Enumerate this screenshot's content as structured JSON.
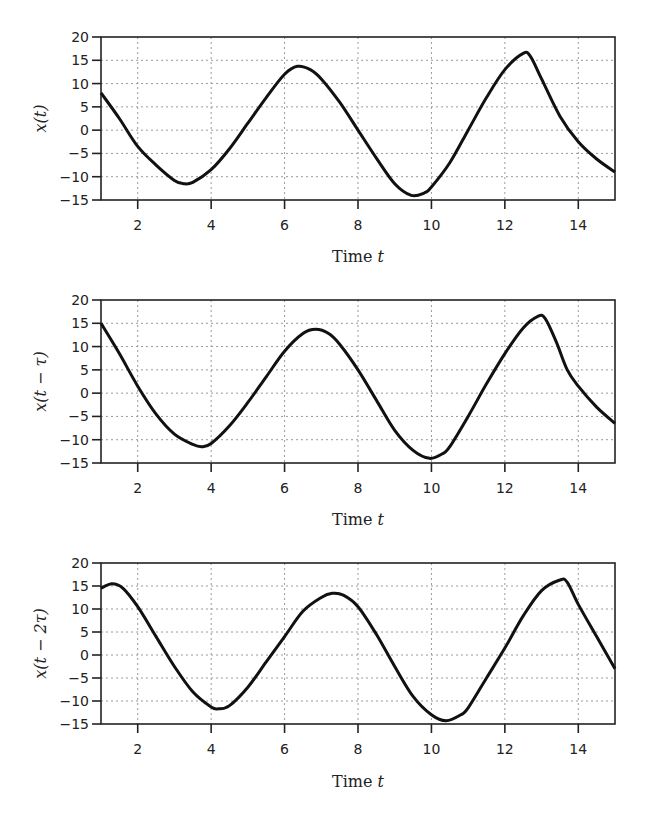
{
  "chart_data": [
    {
      "type": "line",
      "title": "",
      "xlabel": "Time t",
      "ylabel": "x(t)",
      "xlim": [
        1,
        15
      ],
      "ylim": [
        -15,
        20
      ],
      "xticks": [
        2,
        4,
        6,
        8,
        10,
        12,
        14
      ],
      "yticks": [
        20,
        15,
        10,
        5,
        0,
        -5,
        -10,
        -15
      ],
      "grid": true,
      "series": [
        {
          "name": "x(t)",
          "x": [
            1,
            1.5,
            2,
            2.5,
            3,
            3.25,
            3.5,
            4,
            4.5,
            5,
            5.5,
            6,
            6.35,
            6.7,
            7,
            7.5,
            8,
            8.5,
            9,
            9.45,
            9.8,
            10,
            10.5,
            11,
            11.5,
            12,
            12.5,
            12.7,
            13,
            13.5,
            14,
            14.5,
            15
          ],
          "y": [
            8,
            2.5,
            -3.5,
            -7.5,
            -10.8,
            -11.5,
            -11.2,
            -8.5,
            -4,
            1.5,
            7,
            12,
            13.7,
            13,
            11,
            6,
            0,
            -6,
            -11.5,
            -14,
            -13.5,
            -12.2,
            -7,
            0,
            7,
            13,
            16.5,
            15.8,
            11,
            3,
            -2.5,
            -6.2,
            -9
          ]
        }
      ]
    },
    {
      "type": "line",
      "title": "",
      "xlabel": "Time t",
      "ylabel": "x(t − τ)",
      "xlim": [
        1,
        15
      ],
      "ylim": [
        -15,
        20
      ],
      "xticks": [
        2,
        4,
        6,
        8,
        10,
        12,
        14
      ],
      "yticks": [
        20,
        15,
        10,
        5,
        0,
        -5,
        -10,
        -15
      ],
      "grid": true,
      "series": [
        {
          "name": "x(t − τ)",
          "x": [
            1,
            1.5,
            2,
            2.5,
            3,
            3.5,
            3.75,
            4,
            4.5,
            5,
            5.5,
            6,
            6.5,
            6.85,
            7.2,
            7.5,
            8,
            8.5,
            9,
            9.5,
            9.95,
            10.3,
            10.5,
            11,
            11.5,
            12,
            12.5,
            12.9,
            13.1,
            13.4,
            13.7,
            14,
            14.5,
            15
          ],
          "y": [
            15,
            8.5,
            1.5,
            -4.5,
            -8.8,
            -11,
            -11.5,
            -10.8,
            -7,
            -2,
            3.5,
            9,
            12.8,
            13.7,
            12.8,
            10.5,
            5,
            -1.5,
            -8,
            -12.3,
            -14,
            -13,
            -11.5,
            -5,
            2,
            8.5,
            14,
            16.5,
            16,
            11,
            5,
            1.5,
            -3,
            -6.5
          ]
        }
      ]
    },
    {
      "type": "line",
      "title": "",
      "xlabel": "Time t",
      "ylabel": "x(t − 2τ)",
      "xlim": [
        1,
        15
      ],
      "ylim": [
        -15,
        20
      ],
      "xticks": [
        2,
        4,
        6,
        8,
        10,
        12,
        14
      ],
      "yticks": [
        20,
        15,
        10,
        5,
        0,
        -5,
        -10,
        -15
      ],
      "grid": true,
      "series": [
        {
          "name": "x(t − 2τ)",
          "x": [
            1,
            1.3,
            1.6,
            2,
            2.5,
            3,
            3.5,
            4,
            4.2,
            4.5,
            5,
            5.5,
            6,
            6.5,
            7,
            7.3,
            7.6,
            8,
            8.5,
            9,
            9.5,
            10,
            10.4,
            10.8,
            11,
            11.5,
            12,
            12.5,
            13,
            13.5,
            13.7,
            14,
            14.5,
            15
          ],
          "y": [
            14.5,
            15.5,
            14.5,
            10.5,
            4,
            -2.5,
            -8,
            -11.3,
            -11.7,
            -11,
            -7,
            -1.5,
            4,
            9.5,
            12.5,
            13.4,
            13,
            10.5,
            4.5,
            -2.5,
            -9,
            -13,
            -14.3,
            -13,
            -11.5,
            -5,
            1.5,
            8.5,
            14,
            16.3,
            15.8,
            11,
            4,
            -3
          ]
        }
      ]
    }
  ],
  "plots": [
    {
      "ylabel": "x(t)",
      "xlabel_main": "Time ",
      "xlabel_var": "t"
    },
    {
      "ylabel": "x(t − τ)",
      "xlabel_main": "Time ",
      "xlabel_var": "t"
    },
    {
      "ylabel": "x(t − 2τ)",
      "xlabel_main": "Time ",
      "xlabel_var": "t"
    }
  ],
  "style": {
    "line_color": "#111111",
    "grid_color": "#9a9a9a",
    "axis_color": "#222222"
  }
}
